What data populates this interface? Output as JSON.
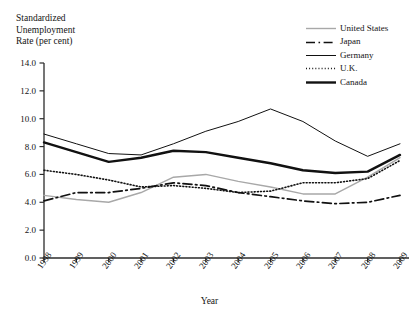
{
  "chart_data": {
    "type": "line",
    "title": "",
    "ylabel": "Standardized Unemployment Rate (per cent)",
    "ylabel_lines": [
      "Standardized",
      "Unemployment",
      "Rate (per cent)"
    ],
    "xlabel": "Year",
    "x": [
      1998,
      1999,
      2000,
      2001,
      2002,
      2003,
      2004,
      2005,
      2006,
      2007,
      2008,
      2009
    ],
    "categories": [
      "1998",
      "1999",
      "2000",
      "2001",
      "2002",
      "2003",
      "2004",
      "2005",
      "2006",
      "2007",
      "2008",
      "2009"
    ],
    "ylim": [
      0.0,
      14.0
    ],
    "yticks": [
      0.0,
      2.0,
      4.0,
      6.0,
      8.0,
      10.0,
      12.0,
      14.0
    ],
    "ytick_labels": [
      "0.0",
      "2.0",
      "4.0",
      "6.0",
      "8.0",
      "10.0",
      "12.0",
      "14.0"
    ],
    "xlim": [
      1998,
      2009
    ],
    "grid": false,
    "legend_position": "top-right",
    "series": [
      {
        "name": "United States",
        "color": "#a8a8a8",
        "style": "solid",
        "width": 1.4,
        "values": [
          4.5,
          4.2,
          4.0,
          4.7,
          5.8,
          6.0,
          5.5,
          5.1,
          4.6,
          4.6,
          5.8,
          7.2
        ]
      },
      {
        "name": "Japan",
        "color": "#111111",
        "style": "dashdot",
        "width": 1.7,
        "values": [
          4.1,
          4.7,
          4.7,
          5.0,
          5.4,
          5.2,
          4.7,
          4.4,
          4.1,
          3.9,
          4.0,
          4.5
        ]
      },
      {
        "name": "Germany",
        "color": "#111111",
        "style": "solid",
        "width": 1.0,
        "values": [
          8.9,
          8.2,
          7.5,
          7.4,
          8.2,
          9.1,
          9.8,
          10.7,
          9.8,
          8.4,
          7.3,
          8.2
        ]
      },
      {
        "name": "U.K.",
        "color": "#111111",
        "style": "dotted",
        "width": 1.6,
        "values": [
          6.3,
          6.0,
          5.6,
          5.1,
          5.2,
          5.0,
          4.7,
          4.8,
          5.4,
          5.4,
          5.7,
          7.0
        ]
      },
      {
        "name": "Canada",
        "color": "#111111",
        "style": "solid",
        "width": 2.4,
        "values": [
          8.3,
          7.6,
          6.9,
          7.2,
          7.7,
          7.6,
          7.2,
          6.8,
          6.3,
          6.1,
          6.2,
          7.4
        ]
      }
    ]
  }
}
